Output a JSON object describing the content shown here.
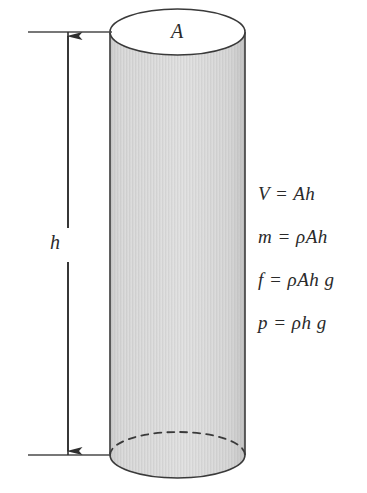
{
  "figure": {
    "background_color": "#ffffff",
    "stroke_color": "#3a3a3a",
    "body_fill_color": "#d4d4d4",
    "cap_fill_color": "#ffffff",
    "text_color": "#2a2a2a"
  },
  "labels": {
    "area_label": "A",
    "height_label": "h"
  },
  "formulas": [
    {
      "text": "V = Ah"
    },
    {
      "text": "m = ρAh"
    },
    {
      "text": "f = ρAh g"
    },
    {
      "text": "p = ρh g"
    }
  ],
  "geometry": {
    "cylinder_left_x": 110,
    "cylinder_right_x": 245,
    "top_ellipse_center_y": 32,
    "bottom_ellipse_center_y": 455,
    "ellipse_radius_y": 23,
    "dimension_arrow_x": 68,
    "reference_line_left_x": 28
  }
}
